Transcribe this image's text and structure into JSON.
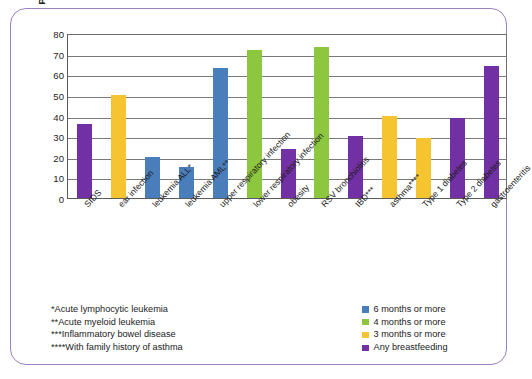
{
  "chart_data": {
    "type": "bar",
    "title": "",
    "xlabel": "",
    "ylabel": "Percent decreased heath risk",
    "ylim": [
      0,
      80
    ],
    "ytick_step": 10,
    "yticks": [
      "80",
      "70",
      "60",
      "50",
      "40",
      "30",
      "20",
      "10",
      "0"
    ],
    "grid": true,
    "legend_position": "bottom-right",
    "categories": [
      "SIDS",
      "ear infection",
      "leukemia ALL*",
      "leukemia AML**",
      "upper respiratory infection",
      "lower respiratory infection",
      "obesity",
      "RSV bronchiolitis",
      "IBD***",
      "asthma****",
      "Type 1 diabetes",
      "Type 2 diabetes",
      "gastroenteritis"
    ],
    "values": [
      36,
      50,
      20,
      15,
      63,
      72,
      24,
      73,
      30,
      40,
      29,
      39,
      64
    ],
    "series_of_each_bar": [
      "Any breastfeeding",
      "3 months or more",
      "6 months or more",
      "6 months or more",
      "6 months or more",
      "4 months or more",
      "Any breastfeeding",
      "4 months or more",
      "Any breastfeeding",
      "3 months or more",
      "3 months or more",
      "Any breastfeeding",
      "Any breastfeeding"
    ],
    "bar_colors": [
      "#7130A3",
      "#F5C430",
      "#4A7EBB",
      "#4A7EBB",
      "#4A7EBB",
      "#8DC63F",
      "#7130A3",
      "#8DC63F",
      "#7130A3",
      "#F5C430",
      "#F5C430",
      "#7130A3",
      "#7130A3"
    ]
  },
  "legend": {
    "items": [
      {
        "label": "6 months or more",
        "color": "#4A7EBB"
      },
      {
        "label": "4 months or more",
        "color": "#8DC63F"
      },
      {
        "label": "3 months or more",
        "color": "#F5C430"
      },
      {
        "label": "Any breastfeeding",
        "color": "#7130A3"
      }
    ]
  },
  "footnotes": [
    "*Acute lymphocytic leukemia",
    "**Acute myeloid leukemia",
    "***Inflammatory bowel disease",
    "****With family history of asthma"
  ],
  "colors": {
    "frame_border": "#9b7fbf",
    "axis": "#5a5a5a",
    "gridline": "#7a7a7a",
    "text": "#1a1a1a"
  }
}
